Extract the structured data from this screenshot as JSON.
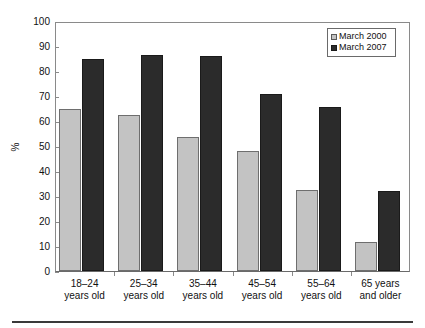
{
  "chart_data": {
    "type": "bar",
    "title": "",
    "subtitle": "",
    "xlabel": "",
    "ylabel": "%",
    "ylim": [
      0,
      100
    ],
    "ytick_step": 10,
    "yticks": [
      100,
      90,
      80,
      70,
      60,
      50,
      40,
      30,
      20,
      10,
      0
    ],
    "ytick_labels": [
      "100",
      "90",
      "80",
      "70",
      "60",
      "50",
      "40",
      "30",
      "20",
      "10",
      "0"
    ],
    "grid": false,
    "legend_position": "top-right",
    "categories": [
      "18–24 years old",
      "25–34 years old",
      "35–44 years old",
      "45–54 years old",
      "55–64 years old",
      "65 years and older"
    ],
    "category_lines": [
      [
        "18–24",
        "years old"
      ],
      [
        "25–34",
        "years old"
      ],
      [
        "35–44",
        "years old"
      ],
      [
        "45–54",
        "years old"
      ],
      [
        "55–64",
        "years old"
      ],
      [
        "65 years",
        "and older"
      ]
    ],
    "series": [
      {
        "name": "March 2000",
        "color": "#c3c3c3",
        "values": [
          65,
          62.5,
          53.5,
          48,
          32.5,
          11.5
        ]
      },
      {
        "name": "March 2007",
        "color": "#2b2b2b",
        "values": [
          85,
          86.5,
          86,
          71,
          65.5,
          32
        ]
      }
    ]
  },
  "legend": {
    "items": [
      {
        "label": "March 2000",
        "swatch": "light-gray-swatch"
      },
      {
        "label": "March 2007",
        "swatch": "dark-swatch"
      }
    ]
  },
  "axes": {
    "y_title": "%"
  }
}
